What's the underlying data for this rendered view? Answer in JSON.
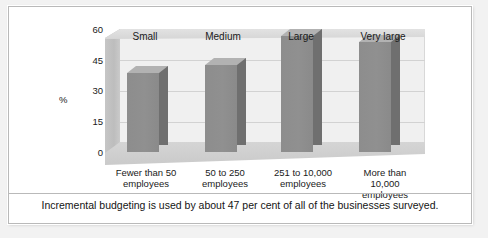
{
  "chart_data": {
    "type": "bar",
    "title": "",
    "subtitle": "",
    "xlabel": "",
    "ylabel": "%",
    "ylim": [
      0,
      60
    ],
    "yticks": [
      60,
      45,
      30,
      15,
      0
    ],
    "grid": true,
    "legend": "none",
    "style": "3d-column",
    "categories": [
      "Fewer than 50 employees",
      "50 to 250 employees",
      "251 to 10,000 employees",
      "More than 10,000 employees"
    ],
    "category_headers": [
      "Small",
      "Medium",
      "Large",
      "Very large"
    ],
    "values": [
      38,
      42,
      56,
      53
    ],
    "series": [
      {
        "name": "Incremental budgeting usage",
        "values": [
          38,
          42,
          56,
          53
        ]
      }
    ],
    "colors": {
      "bar_front": "#8d8d8d",
      "bar_side": "#6f6f6f",
      "bar_top": "#b2b2b2",
      "back_wall": "#f0f0f0",
      "floor": "#cdcdcd",
      "gridline": "#d2d2d2",
      "frame": "#b9b9b9",
      "page_background": "#f2f2f2",
      "text": "#1a1a1a"
    }
  },
  "axis": {
    "unit_label": "%",
    "ticks": [
      {
        "label": "60",
        "value": 60
      },
      {
        "label": "45",
        "value": 45
      },
      {
        "label": "30",
        "value": 30
      },
      {
        "label": "15",
        "value": 15
      },
      {
        "label": "0",
        "value": 0
      }
    ]
  },
  "headers": [
    {
      "label": "Small"
    },
    {
      "label": "Medium"
    },
    {
      "label": "Large"
    },
    {
      "label": "Very large"
    }
  ],
  "category_lines": [
    {
      "line1": "Fewer than 50",
      "line2": "employees",
      "line3": ""
    },
    {
      "line1": "50 to 250",
      "line2": "employees",
      "line3": ""
    },
    {
      "line1": "251 to 10,000",
      "line2": "employees",
      "line3": ""
    },
    {
      "line1": "More than",
      "line2": "10,000",
      "line3": "employees"
    }
  ],
  "caption": {
    "text": "Incremental budgeting is used by about 47 per cent of all of the businesses surveyed."
  }
}
